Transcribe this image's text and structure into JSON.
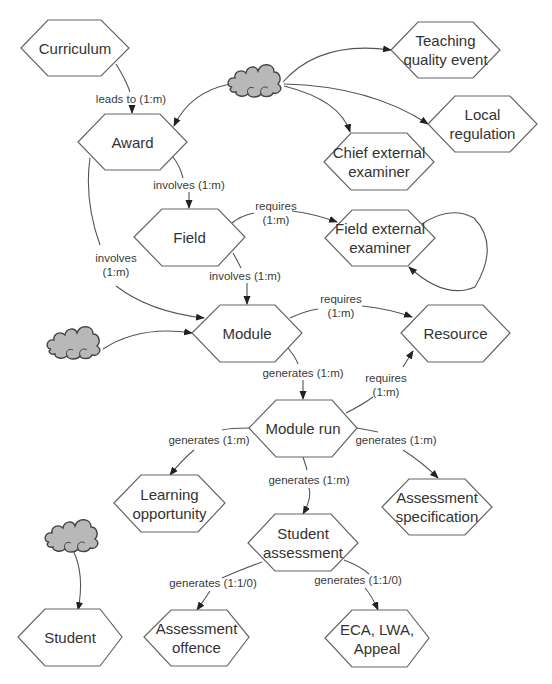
{
  "diagram": {
    "nodes": {
      "curriculum": "Curriculum",
      "teaching_quality_event": "Teaching\nquality event",
      "award": "Award",
      "local_regulation": "Local\nregulation",
      "chief_external_examiner": "Chief external\nexaminer",
      "field": "Field",
      "field_external_examiner": "Field external\nexaminer",
      "module": "Module",
      "resource": "Resource",
      "module_run": "Module run",
      "learning_opportunity": "Learning\nopportunity",
      "assessment_specification": "Assessment\nspecification",
      "student_assessment": "Student\nassessment",
      "student": "Student",
      "assessment_offence": "Assessment\noffence",
      "eca_lwa_appeal": "ECA, LWA,\nAppeal"
    },
    "edges": {
      "curriculum_award": "leads to (1:m)",
      "award_field": "involves (1:m)",
      "award_module": "involves\n(1:m)",
      "field_fee": "requires\n(1:m)",
      "field_module": "involves (1:m)",
      "module_resource": "requires\n(1:m)",
      "module_modulerun": "generates (1:m)",
      "modulerun_resource": "requires\n(1:m)",
      "modulerun_learning": "generates (1:m)",
      "modulerun_spec": "generates (1:m)",
      "modulerun_studentassessment": "generates (1:m)",
      "sa_offence": "generates (1:1/0)",
      "sa_eca": "generates (1:1/0)"
    },
    "external_sources": [
      {
        "name": "cloud-top",
        "targets": [
          "Teaching quality event",
          "Local regulation",
          "Chief external examiner",
          "Award"
        ]
      },
      {
        "name": "cloud-left",
        "targets": [
          "Module"
        ]
      },
      {
        "name": "cloud-bottom-left",
        "targets": [
          "Student"
        ]
      }
    ],
    "colors": {
      "hex_stroke": "#666666",
      "edge_stroke": "#555555",
      "cloud_fill": "#b8b8b8",
      "text": "#333333"
    }
  }
}
